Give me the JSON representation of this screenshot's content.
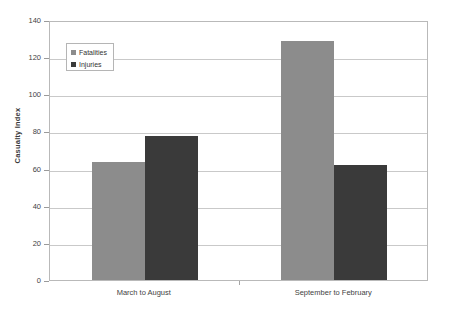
{
  "chart_data": {
    "type": "bar",
    "title": "",
    "xlabel": "",
    "ylabel": "Casualty Index",
    "ylim": [
      0,
      140
    ],
    "yticks": [
      0,
      20,
      40,
      60,
      80,
      100,
      120,
      140
    ],
    "ytick_labels": [
      "0",
      "20",
      "40",
      "60",
      "80",
      "100",
      "120",
      "140"
    ],
    "grid": true,
    "legend_position": "upper-left-inside",
    "categories": [
      "March to August",
      "September to February"
    ],
    "series": [
      {
        "name": "Fatalities",
        "color": "#8c8c8c",
        "values": [
          63.5,
          128.5
        ]
      },
      {
        "name": "Injuries",
        "color": "#3a3a3a",
        "values": [
          77.5,
          62.0
        ]
      }
    ]
  },
  "legend": {
    "items": [
      {
        "label": "Fatalities",
        "color": "#8c8c8c"
      },
      {
        "label": "Injuries",
        "color": "#3a3a3a"
      }
    ]
  },
  "axis": {
    "y_title": "Casualty Index"
  },
  "colors": {
    "plot_border": "#b9b9b9",
    "gridline": "#c9c9c9",
    "background": "#ffffff",
    "tick": "#9a9a9a",
    "text": "#3f3f3f"
  }
}
